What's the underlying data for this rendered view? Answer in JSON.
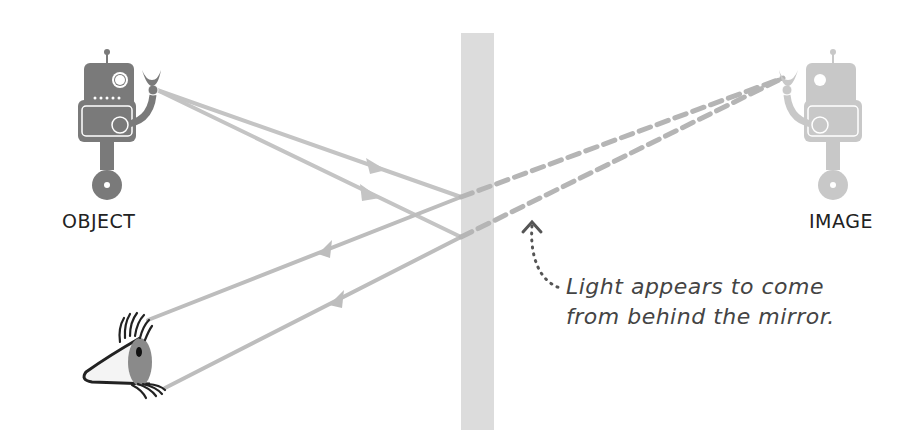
{
  "labels": {
    "object": "OBJECT",
    "image": "IMAGE"
  },
  "annotation": {
    "line1": "Light appears to come",
    "line2": "from behind the mirror."
  },
  "colors": {
    "mirror": "#dcdcdc",
    "ray": "#bdbdbd",
    "object_robot": "#7a7a7a",
    "image_robot": "#c8c8c8",
    "text": "#222222"
  }
}
